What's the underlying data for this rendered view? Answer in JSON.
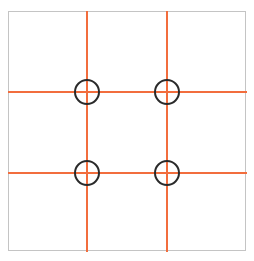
{
  "diagram": {
    "type": "rule-of-thirds-grid",
    "colors": {
      "frame": "#c4c4c4",
      "grid_lines": "#f26d3d",
      "power_points": "#2a2a2a"
    },
    "grid": {
      "vertical_lines_x": [
        87,
        167
      ],
      "horizontal_lines_y": [
        92,
        173
      ]
    },
    "power_points": [
      {
        "name": "top-left",
        "x": 87,
        "y": 92
      },
      {
        "name": "top-right",
        "x": 167,
        "y": 92
      },
      {
        "name": "bottom-left",
        "x": 87,
        "y": 173
      },
      {
        "name": "bottom-right",
        "x": 167,
        "y": 173
      }
    ]
  }
}
